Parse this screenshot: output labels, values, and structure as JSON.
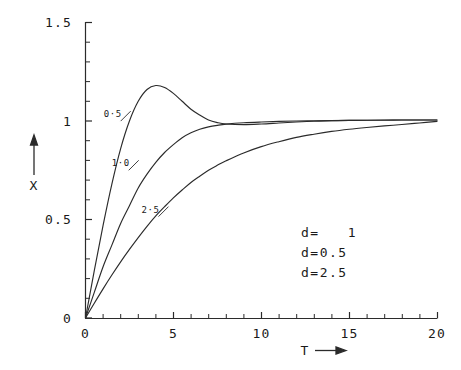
{
  "chart_data": {
    "type": "line",
    "title": "",
    "subtitle": "",
    "xlabel": "T",
    "ylabel": "X",
    "xlim": [
      0,
      20
    ],
    "ylim": [
      0,
      1.5
    ],
    "grid": false,
    "legend_position": "inside-right",
    "x_ticks_major": [
      0,
      5,
      10,
      15,
      20
    ],
    "x_tick_labels": [
      "0",
      "5",
      "10",
      "15",
      "20"
    ],
    "x_minor_step": 1,
    "y_ticks_major": [
      0,
      0.5,
      1,
      1.5
    ],
    "y_tick_labels": [
      "0",
      "0.5",
      "1",
      "1.5"
    ],
    "y_minor_step": 0.1,
    "x": [
      0,
      0.5,
      1,
      1.5,
      2,
      2.5,
      3,
      3.5,
      4,
      4.5,
      5,
      5.5,
      6,
      6.5,
      7,
      7.5,
      8,
      9,
      10,
      11,
      12,
      13,
      14,
      15,
      16,
      17,
      18,
      19,
      20
    ],
    "series": [
      {
        "name": "d=0.5",
        "label": "0·5",
        "label_x": 1.55,
        "label_y": 1.02,
        "values": [
          0,
          0.24,
          0.47,
          0.68,
          0.86,
          1.0,
          1.1,
          1.16,
          1.18,
          1.17,
          1.14,
          1.1,
          1.06,
          1.03,
          1.005,
          0.992,
          0.985,
          0.982,
          0.985,
          0.99,
          0.995,
          0.999,
          1.001,
          1.003,
          1.004,
          1.005,
          1.005,
          1.005,
          1.005
        ]
      },
      {
        "name": "d=1.0",
        "label": "1·0",
        "label_x": 2.0,
        "label_y": 0.77,
        "values": [
          0,
          0.13,
          0.26,
          0.37,
          0.48,
          0.57,
          0.66,
          0.73,
          0.79,
          0.84,
          0.88,
          0.915,
          0.94,
          0.958,
          0.97,
          0.978,
          0.984,
          0.991,
          0.995,
          0.998,
          1.0,
          1.001,
          1.002,
          1.003,
          1.004,
          1.004,
          1.005,
          1.005,
          1.005
        ]
      },
      {
        "name": "d=2.5",
        "label": "2·5",
        "label_x": 3.7,
        "label_y": 0.535,
        "values": [
          0,
          0.075,
          0.148,
          0.218,
          0.285,
          0.348,
          0.408,
          0.465,
          0.518,
          0.565,
          0.61,
          0.65,
          0.688,
          0.72,
          0.75,
          0.775,
          0.798,
          0.838,
          0.87,
          0.895,
          0.917,
          0.933,
          0.947,
          0.958,
          0.967,
          0.975,
          0.982,
          0.99,
          0.998
        ]
      }
    ],
    "legend_entries": [
      "d=   1",
      "d=0.5",
      "d=2.5"
    ],
    "annotations": []
  },
  "axis": {
    "y_arrow_label": "X",
    "x_arrow_label": "T"
  }
}
